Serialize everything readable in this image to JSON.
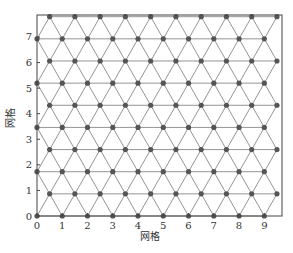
{
  "chart_data": {
    "type": "scatter",
    "subtype": "triangular-lattice-mesh",
    "title": "",
    "xlabel": "网格",
    "ylabel": "网格",
    "xlim": [
      0,
      9.7
    ],
    "ylim": [
      0,
      7.86
    ],
    "xticks": [
      0,
      1,
      2,
      3,
      4,
      5,
      6,
      7,
      8,
      9
    ],
    "yticks": [
      0,
      1,
      2,
      3,
      4,
      5,
      6,
      7
    ],
    "grid": false,
    "legend": null,
    "lattice": {
      "spacing": 1.0,
      "row_spacing": 0.866,
      "rows": 10,
      "even_row_x": [
        0,
        1,
        2,
        3,
        4,
        5,
        6,
        7,
        8,
        9
      ],
      "odd_row_x": [
        0.5,
        1.5,
        2.5,
        3.5,
        4.5,
        5.5,
        6.5,
        7.5,
        8.5,
        9.5
      ],
      "row_y": [
        0,
        0.866,
        1.732,
        2.598,
        3.464,
        4.33,
        5.196,
        6.062,
        6.928,
        7.794
      ]
    },
    "node_color": "#555555",
    "edge_color": "#888888"
  },
  "frame": {
    "left": 37,
    "right": 282,
    "top": 15,
    "bottom": 216
  }
}
